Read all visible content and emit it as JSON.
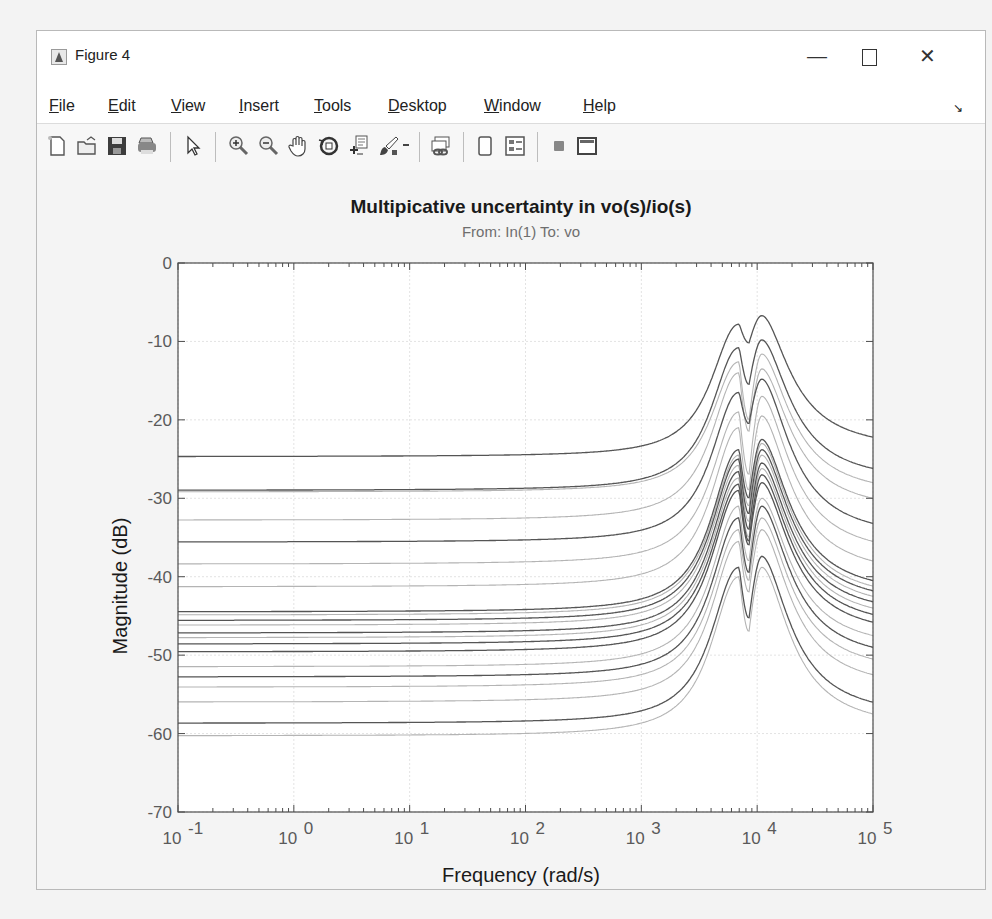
{
  "window": {
    "title": "Figure 4",
    "controls": {
      "minimize": "—",
      "close": "✕"
    }
  },
  "menubar": {
    "items": [
      {
        "label": "File",
        "accel": "F",
        "rest": "ile"
      },
      {
        "label": "Edit",
        "accel": "E",
        "rest": "dit"
      },
      {
        "label": "View",
        "accel": "V",
        "rest": "iew"
      },
      {
        "label": "Insert",
        "accel": "I",
        "rest": "nsert"
      },
      {
        "label": "Tools",
        "accel": "T",
        "rest": "ools"
      },
      {
        "label": "Desktop",
        "accel": "D",
        "rest": "esktop"
      },
      {
        "label": "Window",
        "accel": "W",
        "rest": "indow"
      },
      {
        "label": "Help",
        "accel": "H",
        "rest": "elp"
      }
    ],
    "dock_icon": "↘"
  },
  "toolbar": {
    "items": [
      "new-figure",
      "open-file",
      "save-figure",
      "print-figure",
      "edit-plot",
      "zoom-in",
      "zoom-out",
      "pan",
      "rotate-3d",
      "data-cursor",
      "brush",
      "link-plot",
      "hide-plot-tools",
      "show-plot-tools",
      "insert-colorbar",
      "insert-legend"
    ]
  },
  "chart_data": {
    "type": "line",
    "title": "Multipicative uncertainty in vo(s)/io(s)",
    "subtitle": "From: In(1)  To: vo",
    "xlabel": "Frequency  (rad/s)",
    "ylabel": "Magnitude (dB)",
    "xscale": "log",
    "xlim": [
      0.1,
      100000
    ],
    "ylim": [
      -70,
      0
    ],
    "xticks": [
      "10^-1",
      "10^0",
      "10^1",
      "10^2",
      "10^3",
      "10^4",
      "10^5"
    ],
    "yticks": [
      0,
      -10,
      -20,
      -30,
      -40,
      -50,
      -60,
      -70
    ],
    "grid": true,
    "legend": null,
    "resonance": {
      "peak1_rad_s": 7000,
      "notch_rad_s": 8500,
      "peak2_rad_s": 11000
    },
    "series": [
      {
        "name": "sample-1",
        "shade": "dark",
        "dc_gain_db": -24.7,
        "peak1_db": -7.8,
        "notch_db": -10.2,
        "peak2_db": -6.7,
        "hf_db_at_1e5": -22.2
      },
      {
        "name": "sample-2",
        "shade": "dark",
        "dc_gain_db": -29.0,
        "peak1_db": -10.8,
        "notch_db": -15.5,
        "peak2_db": -9.8,
        "hf_db_at_1e5": -26.2
      },
      {
        "name": "sample-3",
        "shade": "light",
        "dc_gain_db": -29.2,
        "peak1_db": -12.6,
        "notch_db": -20.0,
        "peak2_db": -11.6,
        "hf_db_at_1e5": -28.0
      },
      {
        "name": "sample-4",
        "shade": "light",
        "dc_gain_db": -32.8,
        "peak1_db": -14.0,
        "notch_db": -21.5,
        "peak2_db": -13.5,
        "hf_db_at_1e5": -30.0
      },
      {
        "name": "sample-5",
        "shade": "dark",
        "dc_gain_db": -35.6,
        "peak1_db": -16.5,
        "notch_db": -20.5,
        "peak2_db": -14.8,
        "hf_db_at_1e5": -33.2
      },
      {
        "name": "sample-6",
        "shade": "light",
        "dc_gain_db": -38.4,
        "peak1_db": -19.0,
        "notch_db": -27.0,
        "peak2_db": -17.0,
        "hf_db_at_1e5": -35.5
      },
      {
        "name": "sample-7",
        "shade": "light",
        "dc_gain_db": -41.3,
        "peak1_db": -21.0,
        "notch_db": -29.0,
        "peak2_db": -19.5,
        "hf_db_at_1e5": -38.0
      },
      {
        "name": "sample-8",
        "shade": "dark",
        "dc_gain_db": -44.5,
        "peak1_db": -23.8,
        "notch_db": -30.0,
        "peak2_db": -22.5,
        "hf_db_at_1e5": -40.5
      },
      {
        "name": "sample-9",
        "shade": "light",
        "dc_gain_db": -44.9,
        "peak1_db": -24.5,
        "notch_db": -31.0,
        "peak2_db": -23.0,
        "hf_db_at_1e5": -41.2
      },
      {
        "name": "sample-10",
        "shade": "dark",
        "dc_gain_db": -45.6,
        "peak1_db": -25.0,
        "notch_db": -32.0,
        "peak2_db": -23.8,
        "hf_db_at_1e5": -41.8
      },
      {
        "name": "sample-11",
        "shade": "light",
        "dc_gain_db": -46.2,
        "peak1_db": -25.8,
        "notch_db": -33.0,
        "peak2_db": -24.5,
        "hf_db_at_1e5": -42.5
      },
      {
        "name": "sample-12",
        "shade": "dark",
        "dc_gain_db": -47.2,
        "peak1_db": -26.6,
        "notch_db": -34.0,
        "peak2_db": -25.5,
        "hf_db_at_1e5": -43.2
      },
      {
        "name": "sample-13",
        "shade": "light",
        "dc_gain_db": -47.8,
        "peak1_db": -27.4,
        "notch_db": -35.0,
        "peak2_db": -26.2,
        "hf_db_at_1e5": -44.0
      },
      {
        "name": "sample-14",
        "shade": "dark",
        "dc_gain_db": -48.6,
        "peak1_db": -28.2,
        "notch_db": -35.5,
        "peak2_db": -27.0,
        "hf_db_at_1e5": -44.8
      },
      {
        "name": "sample-15",
        "shade": "dark",
        "dc_gain_db": -49.6,
        "peak1_db": -29.0,
        "notch_db": -36.0,
        "peak2_db": -28.0,
        "hf_db_at_1e5": -45.8
      },
      {
        "name": "sample-16",
        "shade": "light",
        "dc_gain_db": -51.5,
        "peak1_db": -31.0,
        "notch_db": -38.0,
        "peak2_db": -30.0,
        "hf_db_at_1e5": -47.5
      },
      {
        "name": "sample-17",
        "shade": "dark",
        "dc_gain_db": -52.8,
        "peak1_db": -32.5,
        "notch_db": -39.5,
        "peak2_db": -31.0,
        "hf_db_at_1e5": -49.0
      },
      {
        "name": "sample-18",
        "shade": "light",
        "dc_gain_db": -54.1,
        "peak1_db": -34.0,
        "notch_db": -40.5,
        "peak2_db": -32.5,
        "hf_db_at_1e5": -50.5
      },
      {
        "name": "sample-19",
        "shade": "light",
        "dc_gain_db": -56.0,
        "peak1_db": -35.5,
        "notch_db": -42.0,
        "peak2_db": -34.0,
        "hf_db_at_1e5": -52.5
      },
      {
        "name": "sample-20",
        "shade": "dark",
        "dc_gain_db": -58.7,
        "peak1_db": -38.8,
        "notch_db": -45.3,
        "peak2_db": -37.4,
        "hf_db_at_1e5": -56.0
      },
      {
        "name": "sample-21",
        "shade": "light",
        "dc_gain_db": -60.3,
        "peak1_db": -40.0,
        "notch_db": -47.0,
        "peak2_db": -38.8,
        "hf_db_at_1e5": -57.5
      }
    ],
    "colors": {
      "dark": "#555555",
      "light": "#b4b4b4",
      "axes": "#4d4d4d",
      "grid": "#e3e3e3"
    }
  }
}
